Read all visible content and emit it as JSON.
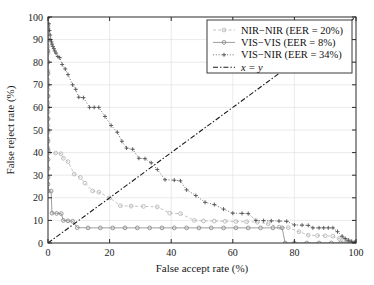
{
  "chart_data": {
    "type": "line",
    "title": "",
    "xlabel": "False accept rate (%)",
    "ylabel": "False reject rate (%)",
    "xlim": [
      0,
      100
    ],
    "ylim": [
      0,
      100
    ],
    "xticks": [
      0,
      20,
      40,
      60,
      80,
      100
    ],
    "yticks": [
      0,
      10,
      20,
      30,
      40,
      50,
      60,
      70,
      80,
      90,
      100
    ],
    "xtick_labels": [
      "0",
      "20",
      "40",
      "60",
      "80",
      "100"
    ],
    "ytick_labels": [
      "0",
      "10",
      "20",
      "30",
      "40",
      "50",
      "60",
      "70",
      "80",
      "90",
      "100"
    ],
    "grid": true,
    "legend_position": "top-right",
    "series": [
      {
        "name": "NIR−NIR (EER = 20%)",
        "label": "NIR−NIR (EER = 20%)",
        "eer": 20,
        "marker": "circle",
        "linestyle": "dashed",
        "color": "#b8b8b8",
        "points": [
          [
            0,
            100
          ],
          [
            0,
            96
          ],
          [
            0,
            93
          ],
          [
            0,
            90
          ],
          [
            0,
            87
          ],
          [
            0,
            84
          ],
          [
            0,
            80
          ],
          [
            0,
            76
          ],
          [
            0,
            72
          ],
          [
            0,
            68
          ],
          [
            0,
            65
          ],
          [
            0,
            62
          ],
          [
            0,
            58
          ],
          [
            0,
            55
          ],
          [
            0,
            52
          ],
          [
            0,
            49
          ],
          [
            0,
            46
          ],
          [
            0,
            42
          ],
          [
            0.3,
            40
          ],
          [
            2.5,
            39.8
          ],
          [
            4.2,
            39.5
          ],
          [
            5.0,
            37.5
          ],
          [
            6.5,
            36.0
          ],
          [
            8.5,
            30.5
          ],
          [
            10.5,
            29.0
          ],
          [
            12.0,
            26.5
          ],
          [
            14.5,
            23.0
          ],
          [
            16.5,
            22.5
          ],
          [
            20.0,
            20.0
          ],
          [
            23.5,
            16.5
          ],
          [
            27.0,
            16.3
          ],
          [
            31.0,
            16.2
          ],
          [
            35.5,
            16.0
          ],
          [
            39.5,
            13.2
          ],
          [
            43.0,
            13.0
          ],
          [
            47.5,
            10.0
          ],
          [
            50.5,
            9.8
          ],
          [
            54.0,
            9.7
          ],
          [
            57.5,
            9.6
          ],
          [
            61.0,
            9.5
          ],
          [
            64.5,
            9.4
          ],
          [
            68.0,
            9.2
          ],
          [
            71.5,
            8.5
          ],
          [
            75.0,
            7.0
          ],
          [
            78.0,
            6.8
          ],
          [
            81.5,
            5.0
          ],
          [
            84.5,
            3.5
          ],
          [
            87.5,
            3.3
          ],
          [
            90.0,
            3.2
          ],
          [
            92.5,
            3.0
          ],
          [
            94.5,
            2.0
          ],
          [
            96.0,
            1.5
          ],
          [
            97.5,
            1.0
          ],
          [
            98.5,
            0.6
          ],
          [
            99.5,
            0.2
          ],
          [
            100,
            0
          ]
        ]
      },
      {
        "name": "VIS−VIS (EER = 8%)",
        "label": "VIS−VIS (EER = 8%)",
        "eer": 8,
        "marker": "circle",
        "linestyle": "solid",
        "color": "#8c8c8c",
        "points": [
          [
            0,
            100
          ],
          [
            0,
            95
          ],
          [
            0,
            90
          ],
          [
            0,
            85
          ],
          [
            0,
            80
          ],
          [
            0,
            75
          ],
          [
            0,
            70
          ],
          [
            0,
            65
          ],
          [
            0,
            60
          ],
          [
            0,
            55
          ],
          [
            0,
            50
          ],
          [
            0,
            45
          ],
          [
            0,
            41
          ],
          [
            0,
            37
          ],
          [
            0,
            33
          ],
          [
            0,
            29
          ],
          [
            0,
            26
          ],
          [
            0,
            23
          ],
          [
            1.0,
            23
          ],
          [
            1.3,
            13.2
          ],
          [
            2.8,
            13.1
          ],
          [
            4.3,
            13.0
          ],
          [
            5.0,
            10.0
          ],
          [
            6.5,
            9.8
          ],
          [
            8.0,
            9.6
          ],
          [
            9.5,
            6.8
          ],
          [
            13.0,
            6.7
          ],
          [
            17.0,
            6.7
          ],
          [
            21.0,
            6.7
          ],
          [
            25.0,
            6.7
          ],
          [
            29.0,
            6.7
          ],
          [
            33.0,
            6.7
          ],
          [
            37.0,
            6.7
          ],
          [
            41.0,
            6.7
          ],
          [
            45.0,
            6.7
          ],
          [
            49.0,
            6.7
          ],
          [
            53.0,
            6.7
          ],
          [
            57.0,
            6.7
          ],
          [
            61.0,
            6.7
          ],
          [
            65.0,
            6.7
          ],
          [
            69.0,
            6.7
          ],
          [
            73.0,
            6.7
          ],
          [
            76.0,
            6.7
          ],
          [
            77.0,
            0
          ],
          [
            80.0,
            0
          ],
          [
            84.0,
            0
          ],
          [
            88.0,
            0
          ],
          [
            92.0,
            0
          ],
          [
            95.0,
            0
          ],
          [
            97.0,
            0
          ],
          [
            98.5,
            0
          ],
          [
            100,
            0
          ]
        ]
      },
      {
        "name": "VIS−NIR (EER = 34%)",
        "label": "VIS−NIR (EER = 34%)",
        "eer": 34,
        "marker": "plus",
        "linestyle": "dotted",
        "color": "#555555",
        "points": [
          [
            0,
            100
          ],
          [
            0.3,
            97
          ],
          [
            0.5,
            94
          ],
          [
            0.7,
            92
          ],
          [
            0.9,
            90
          ],
          [
            1.1,
            89
          ],
          [
            1.3,
            88
          ],
          [
            1.6,
            87
          ],
          [
            1.9,
            86
          ],
          [
            2.2,
            85
          ],
          [
            2.6,
            84
          ],
          [
            3.2,
            82.5
          ],
          [
            3.8,
            82
          ],
          [
            4.6,
            79
          ],
          [
            5.6,
            77
          ],
          [
            6.5,
            74.5
          ],
          [
            8.0,
            70
          ],
          [
            9.0,
            68
          ],
          [
            10.0,
            64.5
          ],
          [
            11.5,
            64.3
          ],
          [
            13.5,
            60
          ],
          [
            15.0,
            60
          ],
          [
            16.5,
            60
          ],
          [
            18.5,
            56
          ],
          [
            20.5,
            52
          ],
          [
            22.5,
            49
          ],
          [
            24.0,
            45
          ],
          [
            25.5,
            42
          ],
          [
            27.5,
            41.5
          ],
          [
            29.5,
            37.5
          ],
          [
            31.5,
            37.3
          ],
          [
            33.5,
            35.5
          ],
          [
            35.5,
            32.5
          ],
          [
            38.0,
            28
          ],
          [
            41.0,
            27.8
          ],
          [
            43.0,
            27.5
          ],
          [
            45.0,
            23.5
          ],
          [
            48.0,
            21
          ],
          [
            51.0,
            18
          ],
          [
            54.0,
            17
          ],
          [
            57.0,
            15
          ],
          [
            60.0,
            13.2
          ],
          [
            63.0,
            13.1
          ],
          [
            65.0,
            13.0
          ],
          [
            67.5,
            10.0
          ],
          [
            70.0,
            9.9
          ],
          [
            72.5,
            9.8
          ],
          [
            75.0,
            9.7
          ],
          [
            77.5,
            9.6
          ],
          [
            80.0,
            8.0
          ],
          [
            82.5,
            7.9
          ],
          [
            84.5,
            7.8
          ],
          [
            86.0,
            6.7
          ],
          [
            88.0,
            6.7
          ],
          [
            89.5,
            6.7
          ],
          [
            91.0,
            6.7
          ],
          [
            92.5,
            6.7
          ],
          [
            94.0,
            5.0
          ],
          [
            95.5,
            3.0
          ],
          [
            96.5,
            2.0
          ],
          [
            97.5,
            1.2
          ],
          [
            98.5,
            0.6
          ],
          [
            99.5,
            0.2
          ],
          [
            100,
            0
          ]
        ]
      },
      {
        "name": "x = y",
        "label": "x = y",
        "marker": "none",
        "linestyle": "dashdot",
        "color": "#1a1a1a",
        "points": [
          [
            0,
            0
          ],
          [
            100,
            100
          ]
        ]
      }
    ]
  },
  "legend": {
    "entries": [
      {
        "label": "NIR−NIR (EER = 20%)",
        "italic": false
      },
      {
        "label": "VIS−VIS (EER = 8%)",
        "italic": false
      },
      {
        "label": "VIS−NIR (EER = 34%)",
        "italic": false
      },
      {
        "label": "x = y",
        "italic": true
      }
    ]
  },
  "colors": {
    "nir_nir": "#b8b8b8",
    "vis_vis": "#8c8c8c",
    "vis_nir": "#555555",
    "identity": "#1a1a1a",
    "grid": "#dcdcdc",
    "axis": "#2a2a2a",
    "background": "#ffffff"
  }
}
